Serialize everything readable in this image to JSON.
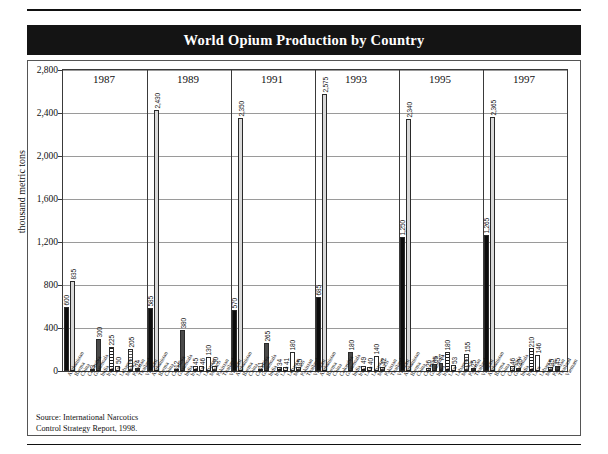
{
  "page": {
    "title": "World Opium Production by Country",
    "source_line1": "Source: International Narcotics",
    "source_line2": "Control Strategy Report, 1998."
  },
  "chart_data": {
    "type": "bar",
    "title": "World Opium Production by Country",
    "xlabel": "",
    "ylabel": "thousand metric tons",
    "ylim": [
      0,
      2800
    ],
    "yticks": [
      "0",
      "400",
      "800",
      "1,200",
      "1,600",
      "2,000",
      "2,400",
      "2,800"
    ],
    "ytick_values": [
      0,
      400,
      800,
      1200,
      1600,
      2000,
      2400,
      2800
    ],
    "grid": true,
    "legend": "none",
    "groups": [
      "1987",
      "1989",
      "1991",
      "1993",
      "1995",
      "1997"
    ],
    "categories": [
      "Afghanistan",
      "Burma",
      "China",
      "Colombia",
      "Guatemala",
      "India",
      "Iran",
      "Laos",
      "Lebanon",
      "Mexico",
      "Pakistan",
      "Thailand",
      "Vietnam"
    ],
    "series": [
      {
        "name": "1987",
        "values": [
          600,
          835,
          0,
          0,
          3,
          300,
          0,
          225,
          50,
          0,
          205,
          24,
          0
        ],
        "labels": [
          "600",
          "835",
          "",
          "",
          "3",
          "300",
          "",
          "225",
          "50",
          "",
          "205",
          "24",
          ""
        ]
      },
      {
        "name": "1989",
        "values": [
          585,
          2430,
          0,
          0,
          12,
          380,
          0,
          45,
          46,
          130,
          50,
          0,
          0
        ],
        "labels": [
          "585",
          "2,430",
          "",
          "",
          "12",
          "380",
          "",
          "45",
          "46",
          "130",
          "50",
          "",
          ""
        ]
      },
      {
        "name": "1991",
        "values": [
          570,
          2350,
          0,
          0,
          11,
          265,
          0,
          34,
          41,
          180,
          35,
          0,
          0
        ],
        "labels": [
          "570",
          "2,350",
          "",
          "",
          "11",
          "265",
          "",
          "34",
          "41",
          "180",
          "35",
          "",
          ""
        ]
      },
      {
        "name": "1993",
        "values": [
          685,
          2575,
          0,
          0,
          0,
          180,
          0,
          49,
          40,
          140,
          42,
          0,
          0
        ],
        "labels": [
          "685",
          "2,575",
          "",
          "",
          "",
          "180",
          "",
          "49",
          "40",
          "140",
          "42",
          "",
          ""
        ]
      },
      {
        "name": "1995",
        "values": [
          1250,
          2340,
          0,
          0,
          26,
          65,
          77,
          180,
          53,
          0,
          155,
          25,
          0
        ],
        "labels": [
          "1,250",
          "2,340",
          "",
          "",
          "26",
          "65",
          "77",
          "180",
          "53",
          "",
          "155",
          "25",
          ""
        ]
      },
      {
        "name": "1997",
        "values": [
          1265,
          2365,
          0,
          0,
          46,
          30,
          0,
          210,
          146,
          0,
          35,
          45,
          0
        ],
        "labels": [
          "1,265",
          "2,365",
          "",
          "",
          "46",
          "30",
          "",
          "210",
          "146",
          "",
          "35",
          "45",
          ""
        ]
      }
    ]
  }
}
